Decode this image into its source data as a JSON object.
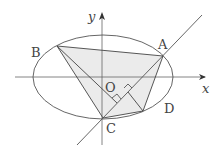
{
  "diagram": {
    "axes": {
      "x_label": "x",
      "y_label": "y"
    },
    "points": {
      "A": "A",
      "B": "B",
      "C": "C",
      "D": "D",
      "O": "O"
    },
    "shape": "ellipse with inscribed quadrilateral ABCD and line through C and A",
    "colors": {
      "stroke": "#555555",
      "fill": "#ebebeb"
    }
  }
}
